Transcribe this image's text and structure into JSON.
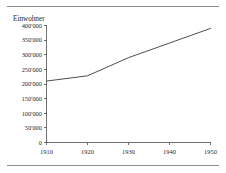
{
  "figure": {
    "background_color": "#ffffff",
    "rule_color": "#8f8f8f",
    "line_color": "#3a3a3a",
    "axis_color": "#4d4d4d",
    "text_color": "#1f1f1f"
  },
  "chart_data": {
    "type": "line",
    "title": "",
    "subtitle": "",
    "ylabel": "Einwohner",
    "xlabel": "",
    "x": [
      1910,
      1920,
      1930,
      1940,
      1950
    ],
    "values": [
      210000,
      228000,
      290000,
      340000,
      390000
    ],
    "series": [
      {
        "name": "Einwohner",
        "values": [
          210000,
          228000,
          290000,
          340000,
          390000
        ]
      }
    ],
    "xlim": [
      1910,
      1950
    ],
    "ylim": [
      0,
      400000
    ],
    "xticks": [
      1910,
      1920,
      1930,
      1940,
      1950
    ],
    "xtick_labels": [
      "1910",
      "1920",
      "1930",
      "1940",
      "1950"
    ],
    "yticks": [
      0,
      50000,
      100000,
      150000,
      200000,
      250000,
      300000,
      350000,
      400000
    ],
    "ytick_labels": [
      "0",
      "50'000",
      "100'000",
      "150'000",
      "200'000",
      "250'000",
      "300'000",
      "350'000",
      "400'000"
    ],
    "grid": false,
    "legend": false,
    "legend_position": "none",
    "annotations": []
  }
}
